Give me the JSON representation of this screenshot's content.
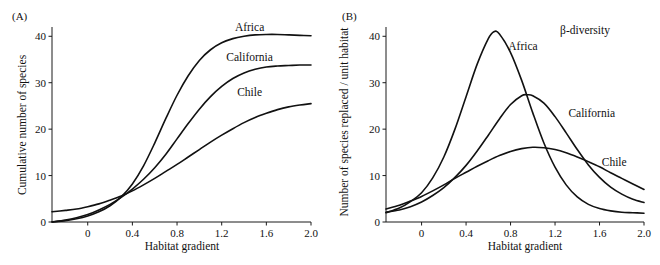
{
  "figure": {
    "width": 660,
    "height": 265,
    "background": "#ffffff",
    "ink_color": "#111111"
  },
  "panels": [
    {
      "id": "A",
      "label": "(A)",
      "ylabel": "Cumulative number of species",
      "xlabel": "Habitat gradient",
      "annotation": "",
      "curve_labels": [
        "Africa",
        "California",
        "Chile"
      ]
    },
    {
      "id": "B",
      "label": "(B)",
      "ylabel": "Number of species replaced / unit habitat",
      "xlabel": "Habitat gradient",
      "annotation": "β-diversity",
      "curve_labels": [
        "Africa",
        "California",
        "Chile"
      ]
    }
  ],
  "chart_data": [
    {
      "type": "line",
      "panel": "A",
      "title": "(A)",
      "xlabel": "Habitat gradient",
      "ylabel": "Cumulative number of species",
      "xlim": [
        -0.32,
        2.0
      ],
      "ylim": [
        0,
        42
      ],
      "xticks": [
        0,
        0.4,
        0.8,
        1.2,
        1.6,
        2.0
      ],
      "xtick_labels": [
        "0",
        "0.4",
        "0.8",
        "1.2",
        "1.6",
        "2.0"
      ],
      "yticks": [
        0,
        10,
        20,
        30,
        40
      ],
      "ytick_labels": [
        "0",
        "10",
        "20",
        "30",
        "40"
      ],
      "grid": false,
      "legend": "inline-curve-labels",
      "series": [
        {
          "name": "Africa",
          "label_x": 1.45,
          "label_y": 42.0,
          "x": [
            -0.32,
            -0.2,
            -0.1,
            0.0,
            0.1,
            0.2,
            0.3,
            0.4,
            0.5,
            0.6,
            0.7,
            0.8,
            0.9,
            1.0,
            1.1,
            1.2,
            1.3,
            1.4,
            1.5,
            1.6,
            1.7,
            1.8,
            1.9,
            2.0
          ],
          "y": [
            0.0,
            0.3,
            0.7,
            1.3,
            2.2,
            3.5,
            5.4,
            8.2,
            12.1,
            17.0,
            22.3,
            27.3,
            31.5,
            34.8,
            37.1,
            38.6,
            39.5,
            40.0,
            40.3,
            40.4,
            40.4,
            40.3,
            40.2,
            40.1
          ]
        },
        {
          "name": "California",
          "label_x": 1.45,
          "label_y": 35.5,
          "x": [
            -0.32,
            -0.2,
            -0.1,
            0.0,
            0.1,
            0.2,
            0.3,
            0.4,
            0.5,
            0.6,
            0.7,
            0.8,
            0.9,
            1.0,
            1.1,
            1.2,
            1.3,
            1.4,
            1.5,
            1.6,
            1.7,
            1.8,
            1.9,
            2.0
          ],
          "y": [
            0.0,
            0.4,
            0.9,
            1.6,
            2.6,
            3.8,
            5.3,
            7.1,
            9.2,
            11.7,
            14.6,
            17.9,
            21.2,
            24.3,
            27.0,
            29.2,
            30.9,
            32.1,
            32.9,
            33.4,
            33.6,
            33.7,
            33.8,
            33.8
          ]
        },
        {
          "name": "Chile",
          "label_x": 1.45,
          "label_y": 28.0,
          "x": [
            -0.32,
            -0.2,
            -0.1,
            0.0,
            0.1,
            0.2,
            0.3,
            0.4,
            0.5,
            0.6,
            0.7,
            0.8,
            0.9,
            1.0,
            1.1,
            1.2,
            1.3,
            1.4,
            1.5,
            1.6,
            1.7,
            1.8,
            1.9,
            2.0
          ],
          "y": [
            2.2,
            2.5,
            2.8,
            3.3,
            3.9,
            4.7,
            5.6,
            6.7,
            8.0,
            9.4,
            10.9,
            12.4,
            14.0,
            15.6,
            17.2,
            18.7,
            20.1,
            21.4,
            22.5,
            23.4,
            24.2,
            24.8,
            25.2,
            25.5
          ]
        }
      ]
    },
    {
      "type": "line",
      "panel": "B",
      "title": "(B)",
      "xlabel": "Habitat gradient",
      "ylabel": "Number of species replaced / unit habitat",
      "annotation": "β-diversity",
      "xlim": [
        -0.32,
        2.0
      ],
      "ylim": [
        0,
        42
      ],
      "xticks": [
        0,
        0.4,
        0.8,
        1.2,
        1.6,
        2.0
      ],
      "xtick_labels": [
        "0",
        "0.4",
        "0.8",
        "1.2",
        "1.6",
        "2.0"
      ],
      "yticks": [
        0,
        10,
        20,
        30,
        40
      ],
      "ytick_labels": [
        "0",
        "10",
        "20",
        "30",
        "40"
      ],
      "grid": false,
      "legend": "inline-curve-labels",
      "series": [
        {
          "name": "Africa",
          "peak_x": 0.63,
          "peak_y": 41.0,
          "label_x": 0.78,
          "label_y": 38.0,
          "x": [
            -0.32,
            -0.2,
            -0.1,
            0.0,
            0.1,
            0.2,
            0.3,
            0.4,
            0.5,
            0.6,
            0.65,
            0.7,
            0.8,
            0.9,
            1.0,
            1.1,
            1.2,
            1.3,
            1.4,
            1.5,
            1.6,
            1.7,
            1.8,
            1.9,
            2.0
          ],
          "y": [
            2.0,
            3.0,
            4.4,
            6.3,
            9.5,
            14.0,
            20.0,
            27.0,
            34.0,
            39.5,
            41.0,
            40.5,
            36.5,
            30.5,
            23.5,
            17.0,
            11.8,
            8.0,
            5.4,
            3.8,
            2.9,
            2.4,
            2.1,
            2.0,
            1.9
          ]
        },
        {
          "name": "California",
          "peak_x": 0.93,
          "peak_y": 27.4,
          "label_x": 1.32,
          "label_y": 23.5,
          "x": [
            -0.32,
            -0.2,
            -0.1,
            0.0,
            0.1,
            0.2,
            0.3,
            0.4,
            0.5,
            0.6,
            0.7,
            0.8,
            0.9,
            0.95,
            1.0,
            1.1,
            1.2,
            1.3,
            1.4,
            1.5,
            1.6,
            1.7,
            1.8,
            1.9,
            2.0
          ],
          "y": [
            2.1,
            2.6,
            3.3,
            4.3,
            5.7,
            7.4,
            9.6,
            12.2,
            15.3,
            18.7,
            22.2,
            25.3,
            27.2,
            27.4,
            27.2,
            25.6,
            22.7,
            19.2,
            15.6,
            12.3,
            9.6,
            7.5,
            6.0,
            4.9,
            4.2
          ]
        },
        {
          "name": "Chile",
          "peak_x": 1.0,
          "peak_y": 16.1,
          "label_x": 1.62,
          "label_y": 13.0,
          "x": [
            -0.32,
            -0.2,
            -0.1,
            0.0,
            0.1,
            0.2,
            0.3,
            0.4,
            0.5,
            0.6,
            0.7,
            0.8,
            0.9,
            1.0,
            1.1,
            1.2,
            1.3,
            1.4,
            1.5,
            1.6,
            1.7,
            1.8,
            1.9,
            2.0
          ],
          "y": [
            2.8,
            3.6,
            4.5,
            5.5,
            6.7,
            8.0,
            9.4,
            10.7,
            12.0,
            13.2,
            14.3,
            15.2,
            15.8,
            16.1,
            16.0,
            15.6,
            14.9,
            14.0,
            13.0,
            11.9,
            10.6,
            9.4,
            8.2,
            7.0
          ]
        }
      ]
    }
  ]
}
